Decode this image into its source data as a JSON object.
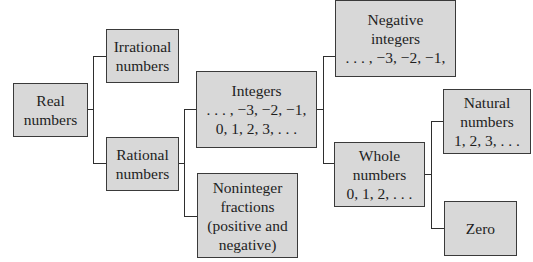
{
  "diagram": {
    "type": "tree",
    "title": "",
    "colors": {
      "box_fill": "#d8d8d8",
      "box_border": "#3a3a3a",
      "connector": "#2e2e2e",
      "text": "#1e1e1e",
      "background": "#ffffff"
    },
    "nodes": {
      "real": {
        "lines": [
          "Real",
          "numbers"
        ]
      },
      "irrational": {
        "lines": [
          "Irrational",
          "numbers"
        ]
      },
      "rational": {
        "lines": [
          "Rational",
          "numbers"
        ]
      },
      "integers": {
        "lines": [
          "Integers",
          ". . . , −3, −2, −1,",
          "0, 1, 2, 3, . . ."
        ]
      },
      "noninteger": {
        "lines": [
          "Noninteger",
          "fractions",
          "(positive and",
          "negative)"
        ]
      },
      "negative": {
        "lines": [
          "Negative",
          "integers",
          ". . . , −3, −2, −1,"
        ]
      },
      "whole": {
        "lines": [
          "Whole",
          "numbers",
          "0, 1, 2, . . ."
        ]
      },
      "natural": {
        "lines": [
          "Natural",
          "numbers",
          "1, 2, 3, . . ."
        ]
      },
      "zero": {
        "lines": [
          "Zero"
        ]
      }
    },
    "edges": [
      [
        "real",
        "irrational"
      ],
      [
        "real",
        "rational"
      ],
      [
        "rational",
        "integers"
      ],
      [
        "rational",
        "noninteger"
      ],
      [
        "integers",
        "negative"
      ],
      [
        "integers",
        "whole"
      ],
      [
        "whole",
        "natural"
      ],
      [
        "whole",
        "zero"
      ]
    ]
  }
}
